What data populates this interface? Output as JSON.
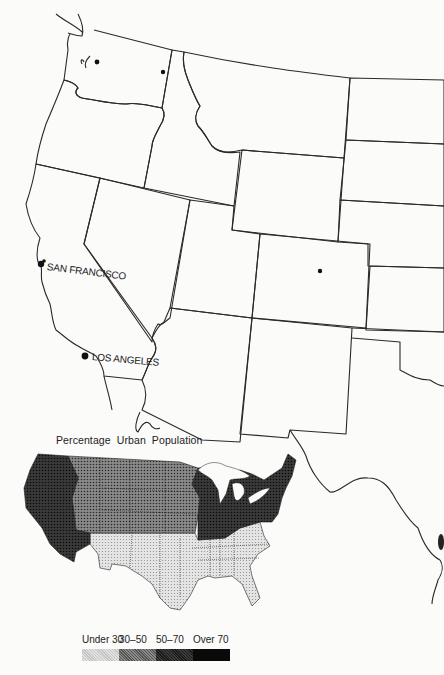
{
  "map": {
    "cities": [
      {
        "name": "SAN FRANCISCO",
        "x": 40,
        "y": 264
      },
      {
        "name": "LOS ANGELES",
        "x": 85,
        "y": 355
      }
    ],
    "unlabeled_cities": [
      {
        "x": 97,
        "y": 62
      },
      {
        "x": 163,
        "y": 72
      },
      {
        "x": 320,
        "y": 271
      }
    ]
  },
  "inset": {
    "title": "Percentage Urban Population",
    "categories": [
      {
        "label": "Under 30",
        "color": "#cfcfcf"
      },
      {
        "label": "30–50",
        "color": "#6e6e6e"
      },
      {
        "label": "50–70",
        "color": "#3a3a3a"
      },
      {
        "label": "Over 70",
        "color": "#0e0e0e"
      }
    ],
    "regions": [
      {
        "name": "Pacific West",
        "category": "Over 70"
      },
      {
        "name": "Mountain and Plains North",
        "category": "50–70"
      },
      {
        "name": "Great Lakes and Northeast",
        "category": "Over 70"
      },
      {
        "name": "South",
        "category": "Under 30"
      }
    ]
  }
}
